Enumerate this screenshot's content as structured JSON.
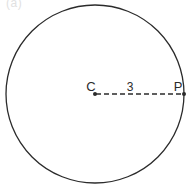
{
  "figure": {
    "type": "geometry-diagram",
    "background_color": "#ffffff",
    "stroke_color": "#2b2b2b",
    "corner_artifact_text": "(a)",
    "circle": {
      "name": "circle",
      "center_x": 95,
      "center_y": 94,
      "radius": 89,
      "stroke_width": 1.3,
      "fill": "none"
    },
    "radius_segment": {
      "name": "radius",
      "from_label": "C",
      "to_label": "P",
      "measure_label": "3",
      "x1": 96,
      "y1": 94,
      "x2": 184,
      "y2": 94,
      "dash_pattern": "5,3",
      "stroke_width": 1.4
    },
    "points": [
      {
        "id": "center",
        "label": "C",
        "x": 95,
        "y": 94,
        "label_x": 91,
        "label_y": 91,
        "dot_radius": 2.0
      },
      {
        "id": "on-circle",
        "label": "P",
        "x": 184,
        "y": 94,
        "label_x": 174,
        "label_y": 91,
        "dot_radius": 2.0
      }
    ],
    "measure": {
      "text": "3",
      "x": 130,
      "y": 91
    }
  }
}
